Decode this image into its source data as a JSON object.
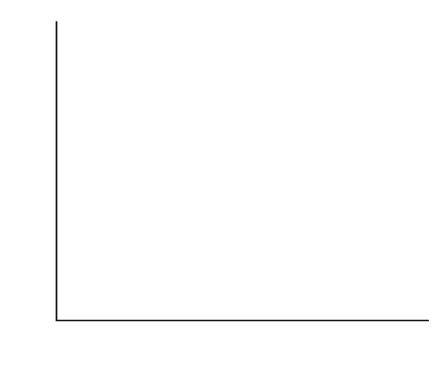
{
  "chart_data": {
    "type": "scatter",
    "title": "",
    "xlabel": "Relative dryness",
    "ylabel": "Abundance",
    "xlim": [
      0,
      26
    ],
    "ylim": [
      0,
      100
    ],
    "xticks": [
      0,
      5,
      10,
      15,
      20,
      25
    ],
    "yticks": [
      0,
      20,
      40,
      60,
      80,
      100
    ],
    "xtick_labels": [
      "0",
      "5",
      "10",
      "15",
      "20",
      "25"
    ],
    "ytick_labels": [
      "0",
      "20",
      "40",
      "60",
      "80",
      "100"
    ],
    "grid": false,
    "legend": "none",
    "series": [
      {
        "name": "circle-group",
        "marker": "circle",
        "color": "#3a3a3a",
        "points": [
          [
            11.2,
            59.0
          ],
          [
            8.2,
            49.5
          ],
          [
            11.6,
            46.5
          ],
          [
            11.3,
            46.0
          ],
          [
            9.4,
            45.0
          ],
          [
            8.8,
            43.5
          ],
          [
            8.8,
            41.5
          ],
          [
            10.6,
            37.0
          ],
          [
            8.9,
            35.0
          ],
          [
            11.6,
            33.5
          ],
          [
            9.5,
            32.0
          ],
          [
            7.6,
            30.5
          ],
          [
            8.2,
            30.0
          ],
          [
            8.2,
            28.5
          ],
          [
            6.9,
            29.0
          ],
          [
            9.4,
            26.5
          ],
          [
            11.9,
            25.5
          ],
          [
            8.2,
            23.0
          ],
          [
            8.2,
            20.5
          ],
          [
            10.6,
            20.0
          ],
          [
            12.8,
            19.5
          ],
          [
            8.1,
            18.0
          ],
          [
            6.2,
            14.5
          ],
          [
            9.9,
            16.0
          ],
          [
            10.0,
            15.5
          ],
          [
            9.8,
            15.0
          ],
          [
            11.7,
            16.0
          ],
          [
            11.9,
            14.5
          ],
          [
            8.5,
            13.0
          ],
          [
            8.2,
            12.0
          ],
          [
            9.9,
            11.5
          ],
          [
            10.0,
            11.0
          ],
          [
            10.1,
            10.5
          ],
          [
            10.0,
            10.0
          ],
          [
            13.2,
            8.5
          ],
          [
            15.9,
            13.5
          ],
          [
            14.1,
            14.5
          ],
          [
            14.1,
            13.0
          ],
          [
            11.2,
            15.0
          ],
          [
            10.4,
            14.0
          ]
        ]
      },
      {
        "name": "cross-group",
        "marker": "cross",
        "color": "#3a3a3a",
        "points": [
          [
            11.3,
            46.0
          ],
          [
            11.6,
            45.5
          ],
          [
            11.9,
            37.5
          ],
          [
            2.4,
            15.0
          ],
          [
            6.9,
            17.0
          ],
          [
            7.7,
            16.5
          ],
          [
            11.6,
            27.0
          ],
          [
            11.7,
            25.5
          ],
          [
            13.5,
            27.0
          ],
          [
            16.1,
            23.0
          ],
          [
            20.0,
            26.5
          ],
          [
            12.1,
            24.5
          ],
          [
            12.1,
            22.5
          ],
          [
            11.6,
            20.5
          ],
          [
            11.7,
            19.5
          ],
          [
            11.9,
            18.0
          ],
          [
            12.9,
            18.5
          ],
          [
            13.0,
            16.5
          ],
          [
            12.6,
            14.5
          ],
          [
            11.8,
            15.5
          ],
          [
            11.6,
            13.0
          ],
          [
            11.6,
            11.5
          ],
          [
            8.2,
            14.5
          ],
          [
            8.3,
            13.0
          ],
          [
            7.7,
            19.0
          ],
          [
            8.2,
            5.5
          ],
          [
            9.0,
            16.0
          ],
          [
            9.9,
            16.5
          ],
          [
            9.9,
            15.5
          ],
          [
            9.9,
            12.5
          ],
          [
            10.0,
            10.5
          ],
          [
            14.1,
            14.0
          ],
          [
            15.9,
            13.0
          ],
          [
            15.8,
            11.5
          ],
          [
            17.0,
            10.0
          ],
          [
            17.9,
            10.5
          ],
          [
            18.0,
            9.5
          ],
          [
            18.0,
            13.5
          ],
          [
            18.1,
            12.0
          ],
          [
            19.0,
            11.5
          ],
          [
            16.9,
            9.0
          ],
          [
            15.9,
            9.5
          ],
          [
            12.2,
            9.5
          ],
          [
            10.0,
            9.5
          ]
        ]
      }
    ],
    "trend_line": {
      "name": "regression-line",
      "x0": 0,
      "y0": 31.5,
      "x1": 26.0,
      "y1": 15.0,
      "color": "#1a1a1a"
    }
  }
}
